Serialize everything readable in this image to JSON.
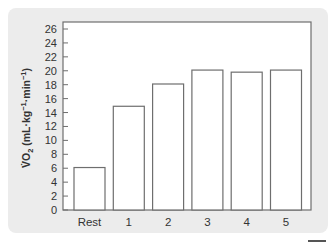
{
  "chart_data": {
    "type": "bar",
    "title": "",
    "xlabel": "",
    "ylabel": "V̇O₂ (mL·kg⁻¹·min⁻¹)",
    "ylabel_parts": {
      "main": "V̇O",
      "sub": "2",
      "rest1": " (mL·kg",
      "sup1": "−1",
      "rest2": "·min",
      "sup2": "−1",
      "rest3": ")"
    },
    "categories": [
      "Rest",
      "1",
      "2",
      "3",
      "4",
      "5"
    ],
    "values": [
      6.1,
      14.9,
      18.1,
      20.1,
      19.8,
      20.1
    ],
    "ylim": [
      0,
      26
    ],
    "yticks": [
      0,
      2,
      4,
      6,
      8,
      10,
      12,
      14,
      16,
      18,
      20,
      22,
      24,
      26
    ],
    "grid": false,
    "legend": "none",
    "colors": {
      "bar_fill": "#ffffff",
      "bar_stroke": "#6e6e6e",
      "axis": "#6e6e6e",
      "panel": "#ececec"
    }
  }
}
